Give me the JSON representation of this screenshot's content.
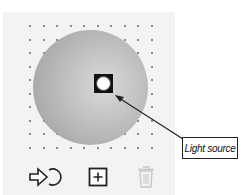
{
  "panel": {
    "background": "#f3f3f3",
    "grid": {
      "columns": 10,
      "rows": 10,
      "dot_color": "#8a8a8a"
    },
    "sphere": {
      "shading": "gray radial gradient",
      "color_edge": "#a3a3a3",
      "color_highlight": "#dadada"
    },
    "light_handle": {
      "icon": "light-source-handle-icon"
    }
  },
  "callout": {
    "label": "Light source"
  },
  "toolbar": {
    "buttons": [
      {
        "name": "apply-light-button",
        "icon": "arrow-into-circle-icon",
        "enabled": true
      },
      {
        "name": "add-light-button",
        "icon": "plus-square-icon",
        "enabled": true
      },
      {
        "name": "delete-light-button",
        "icon": "trash-icon",
        "enabled": false
      }
    ]
  }
}
